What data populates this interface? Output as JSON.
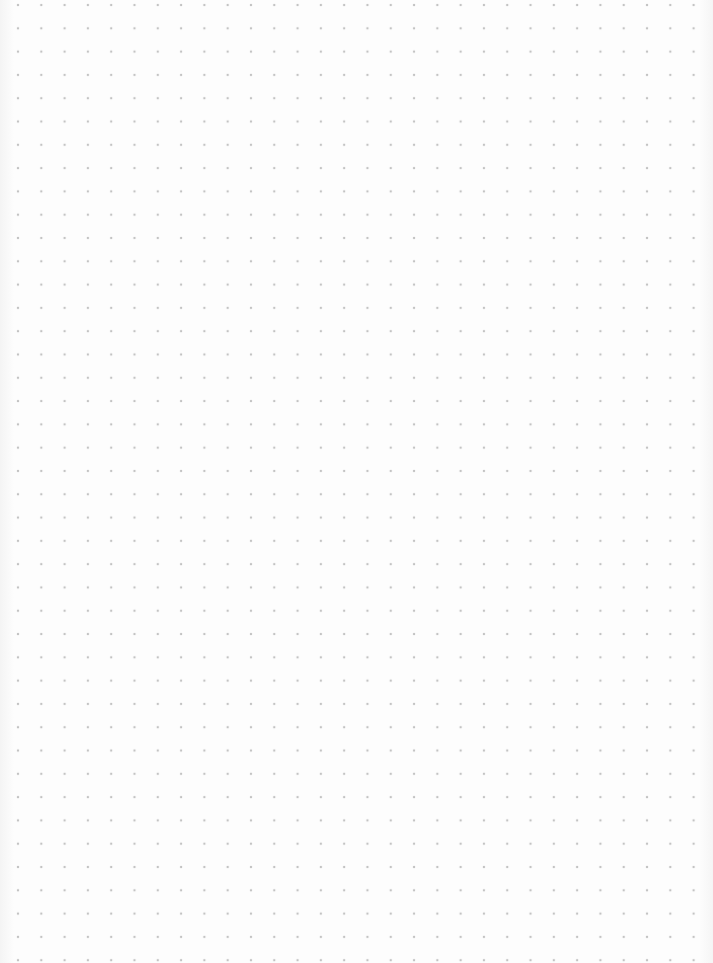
{
  "page": {
    "type": "dot-grid-paper",
    "background_color": "#fdfdfd",
    "dot_color": "#c6c6c6",
    "grid": {
      "spacing_px": 23.3,
      "columns": 30,
      "rows": 41,
      "origin_x": 18,
      "origin_y": 5
    }
  }
}
